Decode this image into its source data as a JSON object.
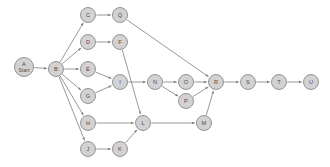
{
  "diagram": {
    "type": "directed-graph",
    "title": "",
    "background_color": "#ffffff",
    "node_fill": "#d2d2d2",
    "node_stroke": "#8a8a8a",
    "edge_color": "#7d7d7d",
    "label_color": "#4a4a4a",
    "node_radius": 7.5,
    "start_node_radius": 9.5,
    "nodes": [
      {
        "id": "A",
        "label": "A",
        "sublabel": "Start",
        "x": 24,
        "y": 67,
        "r": 9.5
      },
      {
        "id": "B",
        "label": "B",
        "sublabel": "",
        "x": 56,
        "y": 69,
        "r": 7.5
      },
      {
        "id": "C",
        "label": "C",
        "sublabel": "",
        "x": 88,
        "y": 15,
        "r": 7.5
      },
      {
        "id": "Q",
        "label": "Q",
        "sublabel": "",
        "x": 120,
        "y": 15,
        "r": 7.5
      },
      {
        "id": "D",
        "label": "D",
        "sublabel": "",
        "x": 88,
        "y": 42,
        "r": 7.5
      },
      {
        "id": "F",
        "label": "F",
        "sublabel": "",
        "x": 120,
        "y": 42,
        "r": 7.5
      },
      {
        "id": "E",
        "label": "E",
        "sublabel": "",
        "x": 88,
        "y": 69,
        "r": 7.5
      },
      {
        "id": "G",
        "label": "G",
        "sublabel": "",
        "x": 88,
        "y": 96,
        "r": 7.5
      },
      {
        "id": "I",
        "label": "I",
        "sublabel": "",
        "x": 120,
        "y": 82,
        "r": 7.5
      },
      {
        "id": "N",
        "label": "N",
        "sublabel": "",
        "x": 155,
        "y": 82,
        "r": 7.5
      },
      {
        "id": "O",
        "label": "O",
        "sublabel": "",
        "x": 186,
        "y": 82,
        "r": 7.5
      },
      {
        "id": "P",
        "label": "P",
        "sublabel": "",
        "x": 186,
        "y": 101,
        "r": 7.5
      },
      {
        "id": "R",
        "label": "R",
        "sublabel": "",
        "x": 216,
        "y": 82,
        "r": 7.5
      },
      {
        "id": "S",
        "label": "S",
        "sublabel": "",
        "x": 248,
        "y": 82,
        "r": 7.5
      },
      {
        "id": "T",
        "label": "T",
        "sublabel": "",
        "x": 279,
        "y": 82,
        "r": 7.5
      },
      {
        "id": "U",
        "label": "U",
        "sublabel": "",
        "x": 311,
        "y": 82,
        "r": 7.5
      },
      {
        "id": "H",
        "label": "H",
        "sublabel": "",
        "x": 88,
        "y": 123,
        "r": 7.5
      },
      {
        "id": "L",
        "label": "L",
        "sublabel": "",
        "x": 143,
        "y": 123,
        "r": 7.5
      },
      {
        "id": "M",
        "label": "M",
        "sublabel": "",
        "x": 204,
        "y": 123,
        "r": 7.5
      },
      {
        "id": "J",
        "label": "J",
        "sublabel": "",
        "x": 88,
        "y": 149,
        "r": 7.5
      },
      {
        "id": "K",
        "label": "K",
        "sublabel": "",
        "x": 120,
        "y": 149,
        "r": 7.5
      }
    ],
    "edges": [
      {
        "from": "A",
        "to": "B"
      },
      {
        "from": "B",
        "to": "C"
      },
      {
        "from": "B",
        "to": "D"
      },
      {
        "from": "B",
        "to": "E"
      },
      {
        "from": "B",
        "to": "G"
      },
      {
        "from": "B",
        "to": "H"
      },
      {
        "from": "B",
        "to": "J"
      },
      {
        "from": "C",
        "to": "Q"
      },
      {
        "from": "Q",
        "to": "R"
      },
      {
        "from": "D",
        "to": "F"
      },
      {
        "from": "F",
        "to": "L"
      },
      {
        "from": "E",
        "to": "I"
      },
      {
        "from": "G",
        "to": "I"
      },
      {
        "from": "I",
        "to": "N"
      },
      {
        "from": "N",
        "to": "O"
      },
      {
        "from": "N",
        "to": "P"
      },
      {
        "from": "O",
        "to": "R"
      },
      {
        "from": "P",
        "to": "R"
      },
      {
        "from": "R",
        "to": "S"
      },
      {
        "from": "S",
        "to": "T"
      },
      {
        "from": "T",
        "to": "U"
      },
      {
        "from": "H",
        "to": "L"
      },
      {
        "from": "J",
        "to": "K"
      },
      {
        "from": "K",
        "to": "L"
      },
      {
        "from": "L",
        "to": "M"
      },
      {
        "from": "M",
        "to": "R"
      }
    ]
  }
}
